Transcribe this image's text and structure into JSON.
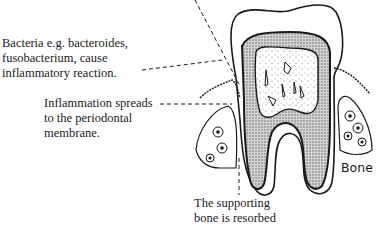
{
  "diagram": {
    "labels": {
      "bacteria": [
        "Bacteria e.g. bacteroides,",
        "fusobacterium, cause",
        "inflammatory reaction."
      ],
      "inflammation": [
        "Inflammation spreads",
        "to the periodontal",
        "membrane."
      ],
      "bone_resorbed": [
        "The supporting",
        "bone is resorbed"
      ],
      "bone": "Bone"
    },
    "colors": {
      "ink": "#1a1a1a",
      "dentine_fill": "#bdbdbd",
      "background": "#ffffff"
    }
  }
}
